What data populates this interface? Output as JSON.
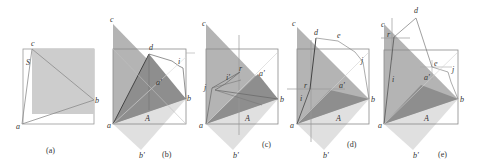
{
  "figure": {
    "colors": {
      "outline": "#8a8a8a",
      "dark": "#7e7e7e",
      "mid": "#a8a8a8",
      "light": "#cfcfcf",
      "pale": "#e2e2e2",
      "line": "#555555",
      "thin": "#b5b5b5"
    },
    "panels": [
      {
        "id": "a",
        "caption": "(a)",
        "labels": {
          "c": "c",
          "s": "S",
          "b": "b",
          "a": "a"
        }
      },
      {
        "id": "b",
        "caption": "(b)",
        "labels": {
          "c": "c",
          "d": "d",
          "i": "i",
          "a2": "a'",
          "b": "b",
          "A": "A",
          "a": "a",
          "b2": "b'"
        }
      },
      {
        "id": "c",
        "caption": "(c)",
        "labels": {
          "c": "c",
          "r": "r",
          "i2": "i'",
          "a2": "a'",
          "j": "j",
          "b": "b",
          "A": "A",
          "a": "a",
          "b2": "b'"
        }
      },
      {
        "id": "d",
        "caption": "(d)",
        "labels": {
          "c": "c",
          "d": "d",
          "e": "e",
          "j": "j",
          "a2": "a'",
          "r": "r",
          "i": "i",
          "b": "b",
          "A": "A",
          "a": "a",
          "b2": "b'"
        }
      },
      {
        "id": "e",
        "caption": "(e)",
        "labels": {
          "c": "c",
          "d": "d",
          "r": "r",
          "e": "e",
          "j": "j",
          "a2": "a'",
          "i": "i",
          "b": "b",
          "A": "A",
          "a": "a",
          "b2": "b'"
        }
      }
    ]
  }
}
